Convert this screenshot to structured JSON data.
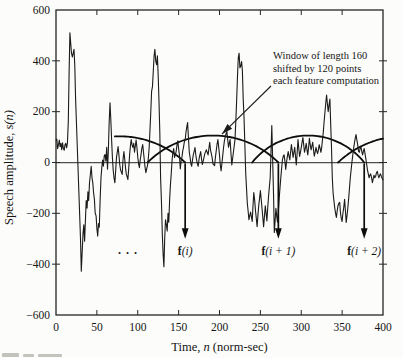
{
  "chart_data": {
    "type": "line",
    "title": "",
    "xlabel": {
      "pre": "Time, ",
      "var": "n",
      "post": " (norm-sec)"
    },
    "ylabel": {
      "pre": "Speech amplitude, ",
      "var": "s(n)"
    },
    "xlim": [
      0,
      400
    ],
    "ylim": [
      -600,
      600
    ],
    "x_ticks": [
      0,
      50,
      100,
      150,
      200,
      250,
      300,
      350,
      400
    ],
    "x_tick_labels": [
      "0",
      "50",
      "100",
      "150",
      "200",
      "250",
      "300",
      "350",
      "400"
    ],
    "y_ticks": [
      600,
      400,
      200,
      0,
      -200,
      -400,
      -600
    ],
    "y_tick_labels": [
      "600",
      "400",
      "200",
      "0",
      "−200",
      "−400",
      "−600"
    ],
    "grid": false,
    "annotation": {
      "lines": [
        "Window of length 160",
        "shifted by 120 points",
        "each feature computation"
      ],
      "arrow_from": [
        263,
        301
      ],
      "arrow_to": [
        203,
        112
      ]
    },
    "window_length": 160,
    "window_shift": 120,
    "windows": [
      {
        "chord": [
          -2,
          158
        ],
        "peak": 103,
        "draw": [
          72,
          158
        ]
      },
      {
        "chord": [
          112,
          272
        ],
        "peak": 106,
        "draw": [
          112,
          272
        ]
      },
      {
        "chord": [
          240,
          377
        ],
        "peak": 106,
        "draw": [
          240,
          377
        ]
      },
      {
        "chord": [
          345,
          505
        ],
        "peak": 103,
        "draw": [
          345,
          400
        ]
      }
    ],
    "feature_arrows": [
      {
        "x": 158,
        "tip_y": -300,
        "label_y": -348,
        "label_head": "f",
        "label_rest": "(i)"
      },
      {
        "x": 272,
        "tip_y": -300,
        "label_y": -348,
        "label_head": "f",
        "label_rest": "(i + 1)"
      },
      {
        "x": 377,
        "tip_y": -300,
        "label_y": -348,
        "label_head": "f",
        "label_rest": "(i + 2)"
      }
    ],
    "ellipsis": {
      "text": ". . ."
    },
    "waveform": [
      [
        0,
        85
      ],
      [
        1,
        92
      ],
      [
        2,
        55
      ],
      [
        3,
        70
      ],
      [
        4,
        88
      ],
      [
        5,
        62
      ],
      [
        6,
        75
      ],
      [
        7,
        50
      ],
      [
        8,
        78
      ],
      [
        9,
        55
      ],
      [
        10,
        48
      ],
      [
        11,
        70
      ],
      [
        12,
        75
      ],
      [
        13,
        58
      ],
      [
        14,
        75
      ],
      [
        15,
        160
      ],
      [
        16,
        350
      ],
      [
        17,
        510
      ],
      [
        18,
        470
      ],
      [
        19,
        430
      ],
      [
        20,
        415
      ],
      [
        21,
        430
      ],
      [
        22,
        445
      ],
      [
        23,
        380
      ],
      [
        24,
        250
      ],
      [
        26,
        60
      ],
      [
        28,
        -120
      ],
      [
        30,
        -300
      ],
      [
        31,
        -428
      ],
      [
        33,
        -280
      ],
      [
        34,
        -245
      ],
      [
        35,
        -310
      ],
      [
        37,
        -150
      ],
      [
        38,
        -180
      ],
      [
        39,
        -115
      ],
      [
        40,
        -150
      ],
      [
        41,
        -80
      ],
      [
        43,
        -15
      ],
      [
        44,
        -60
      ],
      [
        45,
        -80
      ],
      [
        46,
        -120
      ],
      [
        47,
        -145
      ],
      [
        48,
        -200
      ],
      [
        49,
        -210
      ],
      [
        50,
        -260
      ],
      [
        51,
        -290
      ],
      [
        52,
        -240
      ],
      [
        53,
        -255
      ],
      [
        54,
        -150
      ],
      [
        55,
        -60
      ],
      [
        56,
        -20
      ],
      [
        57,
        10
      ],
      [
        58,
        -15
      ],
      [
        59,
        25
      ],
      [
        60,
        31
      ],
      [
        61,
        5
      ],
      [
        62,
        60
      ],
      [
        63,
        -26
      ],
      [
        64,
        40
      ],
      [
        65,
        150
      ],
      [
        66,
        235
      ],
      [
        67,
        170
      ],
      [
        68,
        90
      ],
      [
        69,
        20
      ],
      [
        70,
        -30
      ],
      [
        71,
        -60
      ],
      [
        72,
        -80
      ],
      [
        73,
        -30
      ],
      [
        74,
        20
      ],
      [
        76,
        63
      ],
      [
        77,
        30
      ],
      [
        78,
        -10
      ],
      [
        79,
        -30
      ],
      [
        81,
        -47
      ],
      [
        82,
        10
      ],
      [
        83,
        43
      ],
      [
        84,
        15
      ],
      [
        85,
        -20
      ],
      [
        86,
        -45
      ],
      [
        88,
        -67
      ],
      [
        89,
        -20
      ],
      [
        90,
        30
      ],
      [
        91,
        65
      ],
      [
        92,
        90
      ],
      [
        93,
        70
      ],
      [
        94,
        60
      ],
      [
        95,
        75
      ],
      [
        96,
        40
      ],
      [
        97,
        65
      ],
      [
        98,
        88
      ],
      [
        99,
        60
      ],
      [
        100,
        20
      ],
      [
        101,
        -5
      ],
      [
        102,
        -20
      ],
      [
        103,
        10
      ],
      [
        104,
        30
      ],
      [
        105,
        55
      ],
      [
        106,
        71
      ],
      [
        107,
        40
      ],
      [
        108,
        10
      ],
      [
        109,
        -20
      ],
      [
        110,
        -40
      ],
      [
        111,
        -25
      ],
      [
        112,
        -10
      ],
      [
        113,
        20
      ],
      [
        114,
        60
      ],
      [
        115,
        130
      ],
      [
        116,
        200
      ],
      [
        117,
        280
      ],
      [
        118,
        300
      ],
      [
        119,
        360
      ],
      [
        120,
        420
      ],
      [
        121,
        445
      ],
      [
        122,
        400
      ],
      [
        123,
        385
      ],
      [
        124,
        420
      ],
      [
        125,
        340
      ],
      [
        126,
        240
      ],
      [
        127,
        120
      ],
      [
        128,
        -60
      ],
      [
        129,
        -160
      ],
      [
        130,
        -280
      ],
      [
        131,
        -360
      ],
      [
        132,
        -410
      ],
      [
        133,
        -300
      ],
      [
        134,
        -225
      ],
      [
        135,
        -245
      ],
      [
        136,
        -270
      ],
      [
        137,
        -200
      ],
      [
        138,
        -235
      ],
      [
        139,
        -150
      ],
      [
        140,
        -90
      ],
      [
        141,
        -40
      ],
      [
        142,
        10
      ],
      [
        143,
        40
      ],
      [
        144,
        55
      ],
      [
        145,
        20
      ],
      [
        146,
        30
      ],
      [
        147,
        45
      ],
      [
        148,
        70
      ],
      [
        149,
        85
      ],
      [
        150,
        55
      ],
      [
        151,
        30
      ],
      [
        152,
        -25
      ],
      [
        153,
        5
      ],
      [
        154,
        20
      ],
      [
        155,
        45
      ],
      [
        156,
        60
      ],
      [
        157,
        80
      ],
      [
        158,
        90
      ],
      [
        159,
        120
      ],
      [
        160,
        140
      ],
      [
        161,
        157
      ],
      [
        162,
        100
      ],
      [
        163,
        40
      ],
      [
        164,
        20
      ],
      [
        165,
        -5
      ],
      [
        166,
        -15
      ],
      [
        167,
        10
      ],
      [
        168,
        30
      ],
      [
        169,
        45
      ],
      [
        170,
        59
      ],
      [
        171,
        30
      ],
      [
        172,
        10
      ],
      [
        173,
        -5
      ],
      [
        174,
        -15
      ],
      [
        175,
        15
      ],
      [
        176,
        30
      ],
      [
        177,
        43
      ],
      [
        178,
        15
      ],
      [
        179,
        -8
      ],
      [
        180,
        5
      ],
      [
        181,
        20
      ],
      [
        182,
        35
      ],
      [
        184,
        50
      ],
      [
        185,
        40
      ],
      [
        186,
        30
      ],
      [
        187,
        55
      ],
      [
        188,
        79
      ],
      [
        189,
        50
      ],
      [
        190,
        35
      ],
      [
        191,
        20
      ],
      [
        192,
        -5
      ],
      [
        194,
        -12
      ],
      [
        195,
        20
      ],
      [
        196,
        45
      ],
      [
        197,
        70
      ],
      [
        198,
        90
      ],
      [
        199,
        60
      ],
      [
        200,
        30
      ],
      [
        201,
        -10
      ],
      [
        202,
        -33
      ],
      [
        203,
        0
      ],
      [
        204,
        30
      ],
      [
        205,
        60
      ],
      [
        206,
        85
      ],
      [
        207,
        100
      ],
      [
        208,
        112
      ],
      [
        209,
        122
      ],
      [
        210,
        90
      ],
      [
        211,
        60
      ],
      [
        212,
        75
      ],
      [
        213,
        90
      ],
      [
        214,
        40
      ],
      [
        215,
        -10
      ],
      [
        216,
        15
      ],
      [
        217,
        40
      ],
      [
        218,
        65
      ],
      [
        219,
        90
      ],
      [
        220,
        160
      ],
      [
        221,
        250
      ],
      [
        222,
        340
      ],
      [
        223,
        413
      ],
      [
        224,
        430
      ],
      [
        225,
        373
      ],
      [
        226,
        380
      ],
      [
        227,
        397
      ],
      [
        228,
        360
      ],
      [
        229,
        250
      ],
      [
        230,
        180
      ],
      [
        231,
        80
      ],
      [
        232,
        -40
      ],
      [
        233,
        -100
      ],
      [
        234,
        -160
      ],
      [
        235,
        -190
      ],
      [
        236,
        -225
      ],
      [
        237,
        -210
      ],
      [
        238,
        -195
      ],
      [
        239,
        -215
      ],
      [
        240,
        -232
      ],
      [
        241,
        -170
      ],
      [
        242,
        -118
      ],
      [
        243,
        -150
      ],
      [
        244,
        -190
      ],
      [
        245,
        -220
      ],
      [
        246,
        -252
      ],
      [
        247,
        -210
      ],
      [
        248,
        -170
      ],
      [
        249,
        -140
      ],
      [
        250,
        -110
      ],
      [
        251,
        -145
      ],
      [
        252,
        -180
      ],
      [
        253,
        -215
      ],
      [
        254,
        -252
      ],
      [
        255,
        -210
      ],
      [
        256,
        -170
      ],
      [
        257,
        -200
      ],
      [
        258,
        -230
      ],
      [
        259,
        -180
      ],
      [
        260,
        -130
      ],
      [
        261,
        -95
      ],
      [
        262,
        -60
      ],
      [
        263,
        40
      ],
      [
        264,
        145
      ],
      [
        265,
        20
      ],
      [
        266,
        -120
      ],
      [
        267,
        -275
      ],
      [
        268,
        -230
      ],
      [
        269,
        -180
      ],
      [
        270,
        -210
      ],
      [
        271,
        -235
      ],
      [
        272,
        -190
      ],
      [
        273,
        -140
      ],
      [
        274,
        -100
      ],
      [
        275,
        -60
      ],
      [
        276,
        -25
      ],
      [
        277,
        10
      ],
      [
        278,
        25
      ],
      [
        279,
        30
      ],
      [
        280,
        5
      ],
      [
        281,
        -27
      ],
      [
        282,
        0
      ],
      [
        283,
        25
      ],
      [
        284,
        43
      ],
      [
        285,
        25
      ],
      [
        286,
        10
      ],
      [
        287,
        40
      ],
      [
        288,
        71
      ],
      [
        289,
        45
      ],
      [
        290,
        20
      ],
      [
        291,
        40
      ],
      [
        292,
        60
      ],
      [
        293,
        25
      ],
      [
        294,
        -10
      ],
      [
        295,
        40
      ],
      [
        296,
        90
      ],
      [
        297,
        55
      ],
      [
        298,
        24
      ],
      [
        299,
        40
      ],
      [
        300,
        60
      ],
      [
        301,
        80
      ],
      [
        302,
        98
      ],
      [
        303,
        70
      ],
      [
        304,
        40
      ],
      [
        305,
        55
      ],
      [
        306,
        75
      ],
      [
        307,
        50
      ],
      [
        308,
        30
      ],
      [
        309,
        60
      ],
      [
        310,
        95
      ],
      [
        311,
        70
      ],
      [
        312,
        50
      ],
      [
        313,
        65
      ],
      [
        314,
        80
      ],
      [
        315,
        50
      ],
      [
        316,
        25
      ],
      [
        317,
        40
      ],
      [
        318,
        60
      ],
      [
        319,
        45
      ],
      [
        320,
        35
      ],
      [
        321,
        50
      ],
      [
        322,
        70
      ],
      [
        323,
        55
      ],
      [
        324,
        40
      ],
      [
        325,
        60
      ],
      [
        326,
        90
      ],
      [
        327,
        120
      ],
      [
        328,
        160
      ],
      [
        329,
        200
      ],
      [
        330,
        235
      ],
      [
        331,
        265
      ],
      [
        332,
        230
      ],
      [
        333,
        200
      ],
      [
        334,
        225
      ],
      [
        335,
        250
      ],
      [
        336,
        150
      ],
      [
        337,
        60
      ],
      [
        338,
        -60
      ],
      [
        339,
        -120
      ],
      [
        340,
        -150
      ],
      [
        341,
        -180
      ],
      [
        342,
        -200
      ],
      [
        343,
        -216
      ],
      [
        344,
        -190
      ],
      [
        345,
        -170
      ],
      [
        346,
        -160
      ],
      [
        347,
        -157
      ],
      [
        348,
        -200
      ],
      [
        349,
        -220
      ],
      [
        350,
        -232
      ],
      [
        351,
        -200
      ],
      [
        352,
        -175
      ],
      [
        353,
        -145
      ],
      [
        354,
        -190
      ],
      [
        355,
        -236
      ],
      [
        356,
        -210
      ],
      [
        357,
        -180
      ],
      [
        358,
        -140
      ],
      [
        359,
        -100
      ],
      [
        360,
        -60
      ],
      [
        361,
        -30
      ],
      [
        362,
        0
      ],
      [
        363,
        30
      ],
      [
        364,
        55
      ],
      [
        365,
        75
      ],
      [
        366,
        95
      ],
      [
        367,
        110
      ],
      [
        368,
        90
      ],
      [
        369,
        70
      ],
      [
        370,
        45
      ],
      [
        371,
        40
      ],
      [
        372,
        55
      ],
      [
        373,
        62
      ],
      [
        374,
        45
      ],
      [
        375,
        30
      ],
      [
        376,
        45
      ],
      [
        377,
        55
      ],
      [
        378,
        35
      ],
      [
        379,
        15
      ],
      [
        380,
        -5
      ],
      [
        381,
        -30
      ],
      [
        382,
        -45
      ],
      [
        383,
        -60
      ],
      [
        384,
        -50
      ],
      [
        385,
        -45
      ],
      [
        386,
        -60
      ],
      [
        387,
        -79
      ],
      [
        388,
        -65
      ],
      [
        389,
        -50
      ],
      [
        390,
        -60
      ],
      [
        391,
        -55
      ],
      [
        392,
        -40
      ],
      [
        393,
        -35
      ],
      [
        394,
        -50
      ],
      [
        395,
        -60
      ],
      [
        396,
        -50
      ],
      [
        397,
        -45
      ],
      [
        398,
        -55
      ],
      [
        400,
        -70
      ]
    ],
    "colors": {
      "line": "#1b1b1b",
      "window": "#0d0d0d",
      "axis": "#262626",
      "zero_line": "#4f4f4f"
    }
  }
}
